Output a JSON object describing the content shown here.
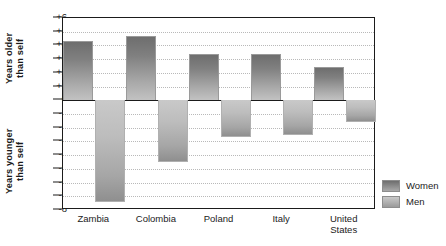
{
  "chart_data": {
    "type": "bar",
    "title": "",
    "subtitle": "",
    "xlabel": "",
    "ylabel_positive": "Years older than self",
    "ylabel_negative": "Years younger than self",
    "ylabel_positive_lines": [
      "Years older",
      "than self"
    ],
    "ylabel_negative_lines": [
      "Years younger",
      "than self"
    ],
    "categories": [
      "Zambia",
      "Colombia",
      "Poland",
      "Italy",
      "United\nStates"
    ],
    "series": [
      {
        "name": "Women",
        "values": [
          4.3,
          4.7,
          3.4,
          3.4,
          2.4
        ],
        "color": "#7d7d7d"
      },
      {
        "name": "Men",
        "values": [
          -7.4,
          -4.5,
          -2.7,
          -2.5,
          -1.6
        ],
        "color": "#b5b5b5"
      }
    ],
    "ylim": [
      -8,
      6
    ],
    "yticks": [
      "+6",
      "+5",
      "+4",
      "+3",
      "+2",
      "+1",
      "0",
      "-1",
      "-2",
      "-3",
      "-4",
      "-5",
      "-6",
      "-7",
      "-8"
    ],
    "ytick_values": [
      6,
      5,
      4,
      3,
      2,
      1,
      0,
      -1,
      -2,
      -3,
      -4,
      -5,
      -6,
      -7,
      -8
    ],
    "grid": true,
    "grid_style": "dotted-horizontal",
    "zero_line": 0,
    "legend_position": "right",
    "legend": [
      "Women",
      "Men"
    ]
  },
  "legend": {
    "women_label": "Women",
    "men_label": "Men"
  }
}
